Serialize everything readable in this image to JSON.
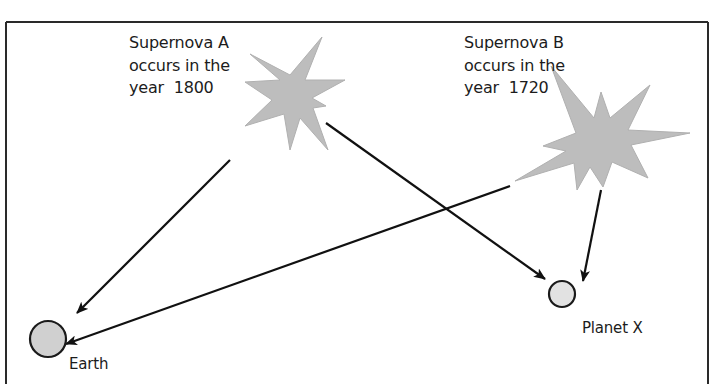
{
  "diagram": {
    "title": "",
    "frame": {
      "stroke_color": "#2a2a2a"
    },
    "supernovae": [
      {
        "name": "Supernova A",
        "lines": [
          "Supernova A",
          "occurs in the",
          "year  1800"
        ],
        "year": 1800,
        "fill_color": "#bdbdbd"
      },
      {
        "name": "Supernova B",
        "lines": [
          "Supernova B",
          "occurs in the",
          "year  1720"
        ],
        "year": 1720,
        "fill_color": "#bdbdbd"
      }
    ],
    "bodies": [
      {
        "name": "Earth",
        "label": "Earth",
        "fill_color": "#d0d0d0"
      },
      {
        "name": "Planet X",
        "label": "Planet X",
        "fill_color": "#e2e2e2"
      }
    ],
    "arrows": [
      {
        "from": "Supernova A",
        "to": "Earth"
      },
      {
        "from": "Supernova A",
        "to": "Planet X"
      },
      {
        "from": "Supernova B",
        "to": "Earth"
      },
      {
        "from": "Supernova B",
        "to": "Planet X"
      }
    ]
  }
}
